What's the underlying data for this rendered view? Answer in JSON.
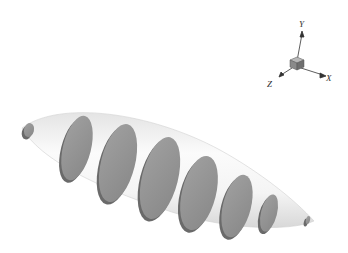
{
  "figure": {
    "background": "#ffffff",
    "body_color": "#f2f2f2",
    "disk_color": "#8f8f8f",
    "disk_shadow_color": "#6a6a6a"
  },
  "axes_triad": {
    "labels": {
      "y": "Y",
      "x": "X",
      "z": "Z"
    }
  },
  "disks": [
    {
      "cx": 29,
      "cy": 130,
      "rx": 5,
      "ry": 7
    },
    {
      "cx": 77,
      "cy": 148,
      "rx": 14,
      "ry": 33
    },
    {
      "cx": 118,
      "cy": 163,
      "rx": 17,
      "ry": 40
    },
    {
      "cx": 160,
      "cy": 178,
      "rx": 18,
      "ry": 42
    },
    {
      "cx": 199,
      "cy": 193,
      "rx": 17,
      "ry": 38
    },
    {
      "cx": 237,
      "cy": 206,
      "rx": 14,
      "ry": 32
    },
    {
      "cx": 269,
      "cy": 213,
      "rx": 8,
      "ry": 19
    },
    {
      "cx": 308,
      "cy": 220,
      "rx": 2,
      "ry": 4
    }
  ]
}
